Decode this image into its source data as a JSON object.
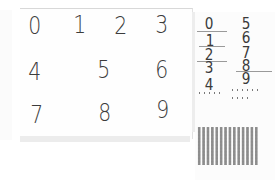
{
  "left_sheet": {
    "rows": [
      [
        "0",
        "1",
        "2",
        "3"
      ],
      [
        "4",
        "5",
        "6"
      ],
      [
        "7",
        "8",
        "9"
      ]
    ]
  },
  "right_sheet": {
    "column_a": [
      "0",
      "1",
      "2",
      "3",
      "4"
    ],
    "column_b": [
      "5",
      "6",
      "7",
      "8",
      "9"
    ]
  },
  "colors": {
    "ink": "#3c3c3c",
    "paper": "#ffffff",
    "shadow": "#ececec",
    "dot": "#8c8c8c"
  }
}
